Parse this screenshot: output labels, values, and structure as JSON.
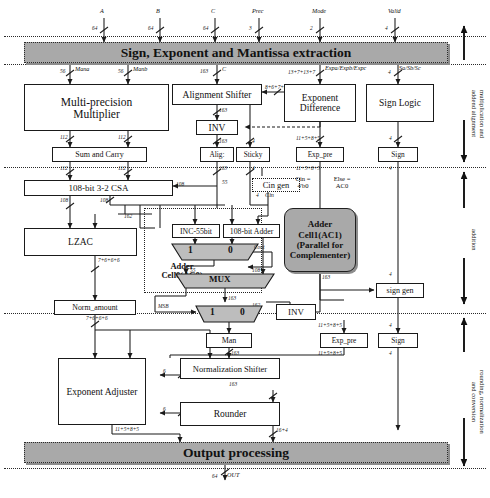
{
  "figure": {
    "caption": ""
  },
  "top_inputs": [
    {
      "name": "A",
      "width": "64"
    },
    {
      "name": "B",
      "width": "64"
    },
    {
      "name": "C",
      "width": "64"
    },
    {
      "name": "Prec",
      "width": "3"
    },
    {
      "name": "Mode",
      "width": "2"
    },
    {
      "name": "Valid",
      "width": "4"
    }
  ],
  "stage_bars": {
    "extraction": "Sign, Exponent and Mantissa extraction",
    "output": "Output processing"
  },
  "stages": [
    {
      "label": "multiplication and\naddend alignment"
    },
    {
      "label": "addition"
    },
    {
      "label": "rounding, normalization\nand conversion"
    }
  ],
  "blocks": {
    "multiplier": "Multi-precision\nMultiplier",
    "alignment_shifter": "Alignment Shifter",
    "exponent_difference": "Exponent\nDifference",
    "sign_logic": "Sign Logic",
    "inv_top": "INV",
    "sum_and_carry": "Sum and Carry",
    "alig": "Alig:",
    "sticky": "Sticky",
    "exp_pre_top": "Exp_pre",
    "sign_top": "Sign",
    "csa": "108-bit 3-2 CSA",
    "cin_gen": "Cin gen",
    "lzac": "LZAC",
    "inc55": "INC-55bit",
    "adder108": "108-bit Adder",
    "mux_label": "MUX",
    "adder_cell0": "Adder\nCell0(AC0)",
    "adder_cell1": "Adder\nCell1(AC1)\n(Parallel for\nComplementer)",
    "cin_const": "Cin =\n4'b0",
    "else_ac0": "Else =\nAC0",
    "sign_gen": "sign gen",
    "inv_bottom": "INV",
    "norm_amount": "Norm_amount",
    "man": "Man",
    "exp_pre_bottom": "Exp_pre",
    "sign_bottom": "Sign",
    "exponent_adjuster": "Exponent Adjuster",
    "normalization_shifter": "Normalization Shifter",
    "rounder": "Rounder"
  },
  "mux_selectors": {
    "one": "1",
    "zero": "0"
  },
  "signal_labels": {
    "mant_a": "Mana",
    "mant_b": "Manb",
    "mant_c": "C",
    "exps": "Expa/Expb/Expc",
    "signs": "Sa/Sb/Sc",
    "shift_amt": "8+6+7+6",
    "cin": "Cin",
    "cout": "Cout",
    "msb": "MSB",
    "out": "OUT"
  },
  "bit_widths": {
    "mant_in": "56",
    "addend_in": "163",
    "exp_in": "13+7+13+7",
    "sign_in": "4",
    "mult_out": "112",
    "sumcarry_out": "112",
    "align_out": "163",
    "inv_out": "163",
    "sticky": "4",
    "exp_pre": "11+5+8+5",
    "sign_w": "4",
    "csa_in_a": "108",
    "csa_in_s": "55",
    "csa_out": "108",
    "csa_out2": "162",
    "lzac_out": "7+6+6+6",
    "inc_out": "55",
    "adder_out": "108",
    "mux_out": "163",
    "man_out": "163",
    "ac1_out": "163",
    "inv2_out": "162",
    "norm_out": "7+6+6+6",
    "shift_ctrl": "6",
    "exp_adj_out": "11+5+8+5",
    "round_out": "16+4",
    "result": "64"
  }
}
